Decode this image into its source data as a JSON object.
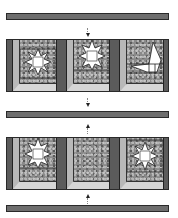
{
  "diagram": {
    "type": "quilt-assembly",
    "colors": {
      "sashing": "#6e6e6e",
      "outline": "#2a2a2a",
      "dark_strip": "#5b5b5b",
      "light_strip": "#b8b8b8",
      "bottom_strip": "#d6d6d6",
      "print_fabric": "#8a8a8a",
      "star_center": "#ffffff"
    },
    "sashing_strips": [
      {
        "id": "top",
        "position": "top"
      },
      {
        "id": "middle",
        "position": "middle"
      },
      {
        "id": "bottom",
        "position": "bottom"
      }
    ],
    "arrows": [
      {
        "direction": "down",
        "between": "top-sashing and row-1"
      },
      {
        "direction": "down",
        "between": "row-1 and middle-sashing"
      },
      {
        "direction": "up",
        "between": "middle-sashing and row-2"
      },
      {
        "direction": "up",
        "between": "row-2 and bottom-sashing"
      }
    ],
    "rows": [
      {
        "blocks": [
          {
            "motif": "star",
            "variant": "full-star"
          },
          {
            "motif": "star",
            "variant": "star-top-cropped"
          },
          {
            "motif": "partial-star",
            "variant": "corner-fragment"
          }
        ]
      },
      {
        "blocks": [
          {
            "motif": "star",
            "variant": "star-top-cropped"
          },
          {
            "motif": "plain",
            "variant": "print-only"
          },
          {
            "motif": "star",
            "variant": "full-star"
          }
        ]
      }
    ]
  }
}
